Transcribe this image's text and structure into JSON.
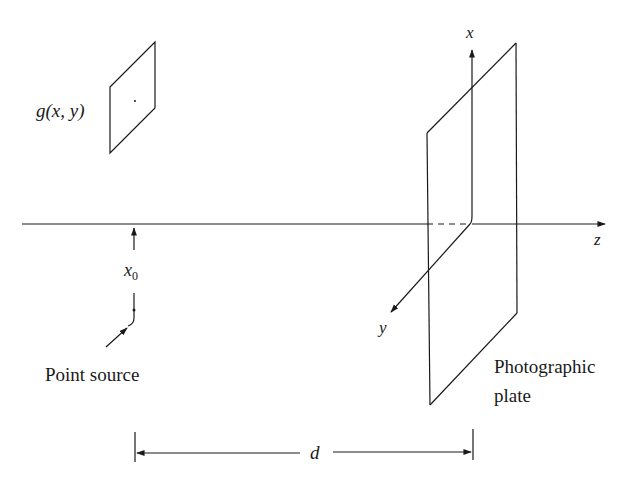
{
  "figure": {
    "labels": {
      "object_function": "g(x, y)",
      "x_offset": "x",
      "x_offset_sub": "0",
      "point_source": "Point source",
      "axis_x": "x",
      "axis_y": "y",
      "axis_z": "z",
      "plate_line1": "Photographic",
      "plate_line2": "plate",
      "distance": "d"
    },
    "colors": {
      "ink": "#1a1a1a",
      "background": "#ffffff"
    }
  }
}
